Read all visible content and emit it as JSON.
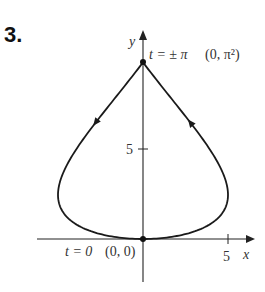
{
  "problem_number": "3.",
  "chart_data": {
    "type": "line",
    "title": "",
    "xlabel": "x",
    "ylabel": "y",
    "equation": {
      "x": "5 sin t",
      "y": "t^2",
      "t_range": [
        -3.14159,
        3.14159
      ]
    },
    "x_ticks": [
      5
    ],
    "y_ticks": [
      5
    ],
    "xlim": [
      -6.5,
      6.8
    ],
    "ylim": [
      -1.9,
      11.5
    ],
    "annotations": [
      {
        "text": "t = ±π  (0, π²)",
        "point": [
          0,
          9.87
        ]
      },
      {
        "text": "t = 0  (0, 0)",
        "point": [
          0,
          0
        ]
      }
    ],
    "direction_arrows": [
      {
        "side": "left",
        "direction": "down"
      },
      {
        "side": "right",
        "direction": "up"
      }
    ],
    "points": [
      [
        0,
        0
      ],
      [
        0,
        9.87
      ]
    ],
    "grid": false,
    "legend": null
  },
  "labels": {
    "x_axis": "x",
    "y_axis": "y",
    "x_tick": "5",
    "y_tick": "5",
    "top_t": "t = ± π",
    "top_point": "(0, π²)",
    "bottom_t": "t = 0",
    "bottom_point": "(0, 0)"
  }
}
